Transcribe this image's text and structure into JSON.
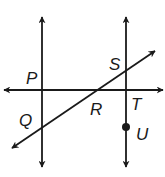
{
  "diagram": {
    "stroke_color": "#1a1a1a",
    "background": "#ffffff",
    "labels": {
      "P": "P",
      "S": "S",
      "Q": "Q",
      "R": "R",
      "T": "T",
      "U": "U"
    },
    "lines": [
      {
        "name": "left-vertical-line",
        "x1": 42,
        "y1": 17,
        "x2": 42,
        "y2": 167
      },
      {
        "name": "right-vertical-line",
        "x1": 126,
        "y1": 17,
        "x2": 126,
        "y2": 167
      },
      {
        "name": "horizontal-line",
        "x1": 4,
        "y1": 90,
        "x2": 163,
        "y2": 90
      },
      {
        "name": "transversal-line",
        "x1": 12,
        "y1": 148,
        "x2": 155,
        "y2": 51
      }
    ],
    "points": [
      {
        "name": "point-U",
        "x": 126,
        "y": 127
      }
    ]
  }
}
